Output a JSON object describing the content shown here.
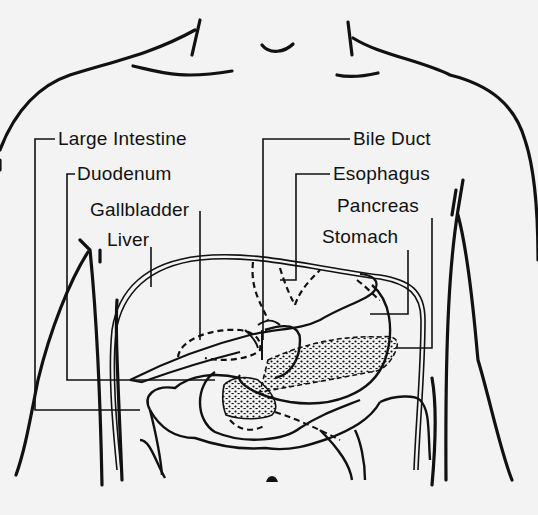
{
  "diagram": {
    "colors": {
      "ink": "#111111",
      "background": "#f3f3f3"
    },
    "labels": {
      "large_intestine": "Large Intestine",
      "duodenum": "Duodenum",
      "gallbladder": "Gallbladder",
      "liver": "Liver",
      "bile_duct": "Bile Duct",
      "esophagus": "Esophagus",
      "pancreas": "Pancreas",
      "stomach": "Stomach"
    }
  }
}
